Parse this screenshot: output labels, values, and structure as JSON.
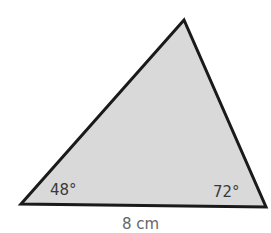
{
  "diagram": {
    "type": "triangle",
    "fill_color": "#d9d9d9",
    "stroke_color": "#1a1a1a",
    "vertices": {
      "left": [
        21,
        204
      ],
      "top": [
        184,
        20
      ],
      "right": [
        266,
        207
      ]
    },
    "angles": {
      "left": "48°",
      "right": "72°"
    },
    "sides": {
      "base": "8 cm"
    }
  }
}
